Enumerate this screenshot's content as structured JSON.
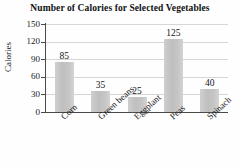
{
  "chart_data": {
    "type": "bar",
    "title": "Number of Calories for Selected Vegetables",
    "xlabel": "",
    "ylabel": "Calories",
    "categories": [
      "Corn",
      "Green beans",
      "Eggplant",
      "Peas",
      "Spinach"
    ],
    "values": [
      85,
      35,
      25,
      125,
      40
    ],
    "value_labels": [
      "85",
      "35",
      "25",
      "125",
      "40"
    ],
    "ylim": [
      0,
      150
    ],
    "yticks": [
      0,
      30,
      60,
      90,
      120,
      150
    ],
    "ytick_labels": [
      "0",
      "30",
      "60",
      "90",
      "120",
      "150"
    ],
    "grid": true,
    "grid_axis": "y",
    "legend": false,
    "legend_position": "none",
    "bar_color": "#c4c4c4",
    "axis_color": "#4a4a4a",
    "grid_color": "#d6d6d6",
    "text_color": "#1a1a1a",
    "background_color": "#fefefe",
    "series": [
      {
        "name": "Calories",
        "values": [
          85,
          35,
          25,
          125,
          40
        ]
      }
    ]
  }
}
